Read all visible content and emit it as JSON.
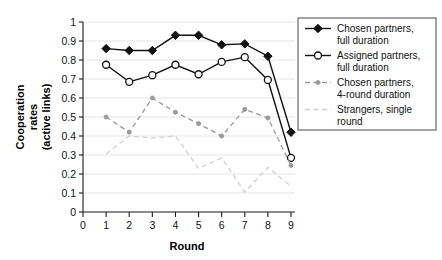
{
  "chart_data": {
    "type": "line",
    "title": "",
    "xlabel": "Round",
    "ylabel": "Cooperation rates (active links)",
    "ylabel_lines": [
      "Cooperation",
      "rates",
      "(active links)"
    ],
    "x": [
      1,
      2,
      3,
      4,
      5,
      6,
      7,
      8,
      9
    ],
    "xlim": [
      0,
      9
    ],
    "ylim": [
      0,
      1
    ],
    "xticks": [
      0,
      1,
      2,
      3,
      4,
      5,
      6,
      7,
      8,
      9
    ],
    "xtick_labels": [
      "0",
      "1",
      "2",
      "3",
      "4",
      "5",
      "6",
      "7",
      "8",
      "9"
    ],
    "yticks": [
      0,
      0.1,
      0.2,
      0.3,
      0.4,
      0.5,
      0.6,
      0.7,
      0.8,
      0.9,
      1
    ],
    "ytick_labels": [
      "0",
      "0.1",
      "0.2",
      "0.3",
      "0.4",
      "0.5",
      "0.6",
      "0.7",
      "0.8",
      "0.9",
      "1"
    ],
    "grid": "horizontal",
    "legend_position": "right",
    "series": [
      {
        "name": "Chosen partners, full duration",
        "label_lines": [
          "Chosen partners,",
          "full duration"
        ],
        "values": [
          0.86,
          0.85,
          0.85,
          0.93,
          0.93,
          0.88,
          0.885,
          0.82,
          0.42
        ],
        "color": "#111111",
        "marker": "filled-diamond",
        "dash": "solid"
      },
      {
        "name": "Assigned partners, full duration",
        "label_lines": [
          "Assigned partners,",
          "full duration"
        ],
        "values": [
          0.775,
          0.685,
          0.72,
          0.775,
          0.725,
          0.79,
          0.815,
          0.695,
          0.285
        ],
        "color": "#111111",
        "marker": "open-circle",
        "dash": "solid"
      },
      {
        "name": "Chosen partners, 4-round duration",
        "label_lines": [
          "Chosen partners,",
          "4-round duration"
        ],
        "values": [
          0.5,
          0.42,
          0.6,
          0.525,
          0.465,
          0.4,
          0.54,
          0.495,
          0.245
        ],
        "color": "#9a9a9a",
        "marker": "small-dot",
        "dash": "dashed"
      },
      {
        "name": "Strangers, single round",
        "label_lines": [
          "Strangers, single",
          "round"
        ],
        "values": [
          0.305,
          0.4,
          0.39,
          0.4,
          0.23,
          0.285,
          0.105,
          0.235,
          0.135
        ],
        "color": "#cfcfcf",
        "marker": "none",
        "dash": "dashed"
      }
    ]
  }
}
